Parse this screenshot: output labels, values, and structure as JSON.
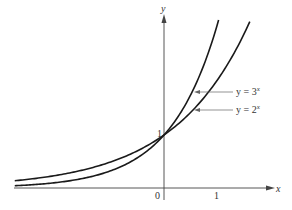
{
  "chart_data": {
    "type": "line",
    "title": "",
    "xlabel": "x",
    "ylabel": "y",
    "x_ticks": [
      "0",
      "1"
    ],
    "y_ticks": [
      "1"
    ],
    "xlim": [
      -2.9,
      2.1
    ],
    "ylim": [
      0,
      3.2
    ],
    "grid": false,
    "legend": "inline labels with arrows, right side",
    "series": [
      {
        "name": "y = 3^x",
        "label_base": "y = 3",
        "label_exp": "x",
        "function": "3^x",
        "x": [
          -2.87,
          -2,
          -1,
          -0.5,
          0,
          0.5,
          1,
          1.05
        ],
        "y": [
          0.043,
          0.111,
          0.333,
          0.577,
          1,
          1.732,
          3,
          3.17
        ]
      },
      {
        "name": "y = 2^x",
        "label_base": "y = 2",
        "label_exp": "x",
        "function": "2^x",
        "x": [
          -2.87,
          -2,
          -1,
          -0.5,
          0,
          0.5,
          1,
          1.5,
          1.65
        ],
        "y": [
          0.137,
          0.25,
          0.5,
          0.707,
          1,
          1.414,
          2,
          2.828,
          3.14
        ]
      }
    ],
    "annotations": [
      "intersection at (0, 1)"
    ]
  },
  "labels": {
    "x_axis": "x",
    "y_axis": "y",
    "origin": "0",
    "x_tick_1": "1",
    "y_tick_1": "1",
    "curve_3x_base": "y = 3",
    "curve_3x_exp": "x",
    "curve_2x_base": "y = 2",
    "curve_2x_exp": "x"
  }
}
